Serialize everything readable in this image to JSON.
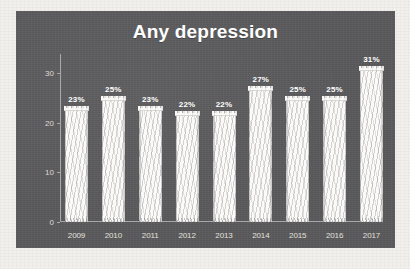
{
  "chart_data": {
    "type": "bar",
    "title": "Any depression",
    "xlabel": "",
    "ylabel": "",
    "categories": [
      "2009",
      "2010",
      "2011",
      "2012",
      "2013",
      "2014",
      "2015",
      "2016",
      "2017"
    ],
    "values": [
      23,
      25,
      23,
      22,
      22,
      27,
      25,
      25,
      31
    ],
    "data_labels": [
      "23%",
      "25%",
      "23%",
      "22%",
      "22%",
      "27%",
      "25%",
      "25%",
      "31%"
    ],
    "ylim": [
      0,
      33
    ],
    "y_ticks": [
      0,
      10,
      20,
      30
    ],
    "y_tick_labels": [
      "0",
      "10",
      "20",
      "30"
    ],
    "grid": false,
    "legend": false,
    "style": "hand-drawn sketch",
    "colors": {
      "panel_background": "#59595b",
      "page_background": "#f2f0ec",
      "bar_fill": "#fbfaf8",
      "title_text": "#ffffff",
      "tick_text": "#dedcd8",
      "axis_line": "#a9a8a6"
    }
  }
}
